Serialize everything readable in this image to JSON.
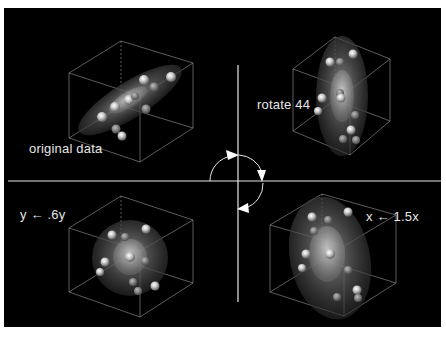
{
  "figure": {
    "background": "#000000",
    "axis_color": "#e8e8e8",
    "panels": [
      {
        "id": "top-left",
        "label": "original data"
      },
      {
        "id": "top-right",
        "label": "rotate 44"
      },
      {
        "id": "bottom-left",
        "label": "y ← .6y"
      },
      {
        "id": "bottom-right",
        "label": "x ← 1.5x"
      }
    ],
    "center_icon": "rotation-arrow-icon"
  }
}
